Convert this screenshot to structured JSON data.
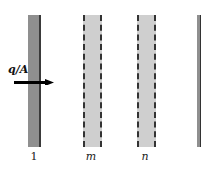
{
  "diagram": {
    "flux_label": "q/A",
    "walls": [
      {
        "id": "1",
        "label": "1",
        "style": "solid-dark",
        "color": "#8f8f8f"
      },
      {
        "id": "m",
        "label": "m",
        "style": "dashed-light",
        "color": "#cfcfcf"
      },
      {
        "id": "n",
        "label": "n",
        "style": "dashed-light",
        "color": "#cfcfcf"
      },
      {
        "id": "right",
        "label": "",
        "style": "solid-dark-partial",
        "color": "#8f8f8f"
      }
    ],
    "arrow": {
      "direction": "right",
      "color": "#000000"
    }
  }
}
